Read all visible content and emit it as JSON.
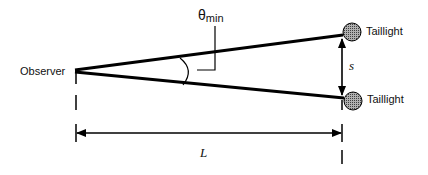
{
  "diagram": {
    "labels": {
      "observer": "Observer",
      "taillight_top": "Taillight",
      "taillight_bottom": "Taillight",
      "separation": "s",
      "distance": "L",
      "angle_symbol": "θ",
      "angle_subscript": "min"
    },
    "colors": {
      "line": "#000000",
      "taillight_fill": "#8a8a8a",
      "background": "#ffffff"
    },
    "geometry": {
      "observer_point": [
        75,
        70
      ],
      "taillight_top_center": [
        352,
        32
      ],
      "taillight_bottom_center": [
        353,
        101
      ],
      "taillight_radius": 9,
      "distance_arrow_y": 133
    }
  }
}
